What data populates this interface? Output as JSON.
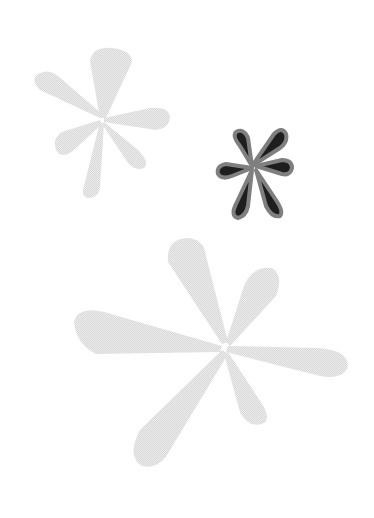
{
  "canvas": {
    "width": 374,
    "height": 518,
    "background": "#ffffff"
  },
  "shapes": [
    {
      "name": "small-light-asterisk",
      "fill": "#e4e4e4",
      "stroke": "none"
    },
    {
      "name": "dark-asterisk",
      "fill": "#1a1a1a",
      "stroke": "#8a8a8a"
    },
    {
      "name": "large-light-asterisk",
      "fill": "#e6e6e6",
      "stroke": "none"
    }
  ]
}
